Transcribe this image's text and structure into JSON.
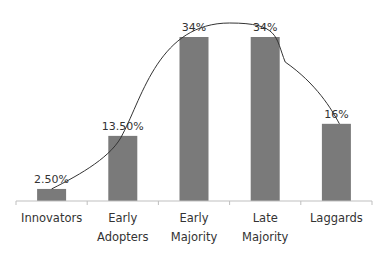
{
  "chart_data": {
    "type": "bar",
    "title": "",
    "xlabel": "",
    "ylabel": "",
    "categories": [
      "Innovators",
      "Early Adopters",
      "Early Majority",
      "Late Majority",
      "Laggards"
    ],
    "category_lines": [
      [
        "Innovators"
      ],
      [
        "Early",
        "Adopters"
      ],
      [
        "Early",
        "Majority"
      ],
      [
        "Late",
        "Majority"
      ],
      [
        "Laggards"
      ]
    ],
    "values": [
      2.5,
      13.5,
      34,
      34,
      16
    ],
    "data_labels": [
      "2.50%",
      "13.50%",
      "34%",
      "34%",
      "16%"
    ],
    "ylim": [
      0,
      40
    ],
    "grid": false,
    "legend": null,
    "overlay": {
      "type": "bell-curve",
      "description": "smooth curve through bar tops (diffusion of innovations)"
    },
    "colors": {
      "bar": "#7a7a7a",
      "curve": "#333333",
      "axis": "#bfbfbf"
    }
  }
}
